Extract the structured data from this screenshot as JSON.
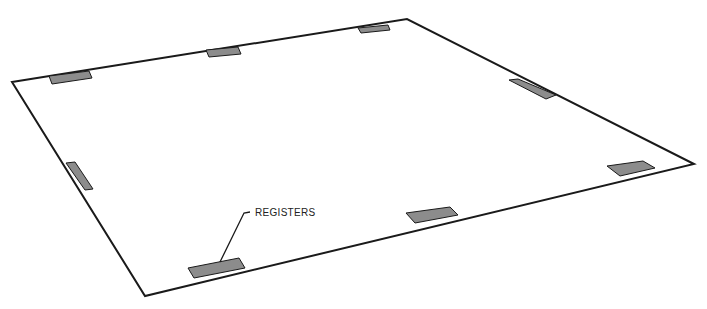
{
  "diagram": {
    "type": "perspective sheet with register marks",
    "outline": {
      "points": [
        [
          12,
          82
        ],
        [
          407,
          19
        ],
        [
          694,
          164
        ],
        [
          145,
          296
        ]
      ],
      "stroke": "#1a1a1a"
    },
    "register_fill": "#8c8c8c",
    "registers": [
      {
        "name": "register-top-left",
        "points": [
          [
            49,
            76
          ],
          [
            89,
            71
          ],
          [
            92,
            78
          ],
          [
            52,
            84
          ]
        ]
      },
      {
        "name": "register-top-middle",
        "points": [
          [
            206,
            50
          ],
          [
            238,
            47
          ],
          [
            241,
            54
          ],
          [
            209,
            57
          ]
        ]
      },
      {
        "name": "register-top-right",
        "points": [
          [
            358,
            28
          ],
          [
            388,
            25
          ],
          [
            390,
            30
          ],
          [
            361,
            33
          ]
        ]
      },
      {
        "name": "register-right-upper",
        "points": [
          [
            509,
            80
          ],
          [
            518,
            79
          ],
          [
            556,
            95
          ],
          [
            546,
            99
          ]
        ]
      },
      {
        "name": "register-right-lower",
        "points": [
          [
            607,
            166
          ],
          [
            643,
            161
          ],
          [
            655,
            168
          ],
          [
            620,
            176
          ]
        ]
      },
      {
        "name": "register-left",
        "points": [
          [
            66,
            163
          ],
          [
            75,
            162
          ],
          [
            93,
            189
          ],
          [
            85,
            190
          ]
        ]
      },
      {
        "name": "register-bottom-middle",
        "points": [
          [
            406,
            213
          ],
          [
            450,
            207
          ],
          [
            458,
            215
          ],
          [
            415,
            223
          ]
        ]
      },
      {
        "name": "register-bottom-left",
        "points": [
          [
            188,
            268
          ],
          [
            239,
            258
          ],
          [
            245,
            268
          ],
          [
            194,
            278
          ]
        ]
      }
    ],
    "callout": {
      "label": "REGISTERS",
      "label_pos": [
        255,
        207
      ],
      "leader": [
        [
          250,
          212
        ],
        [
          244,
          213
        ],
        [
          220,
          262
        ]
      ]
    }
  }
}
